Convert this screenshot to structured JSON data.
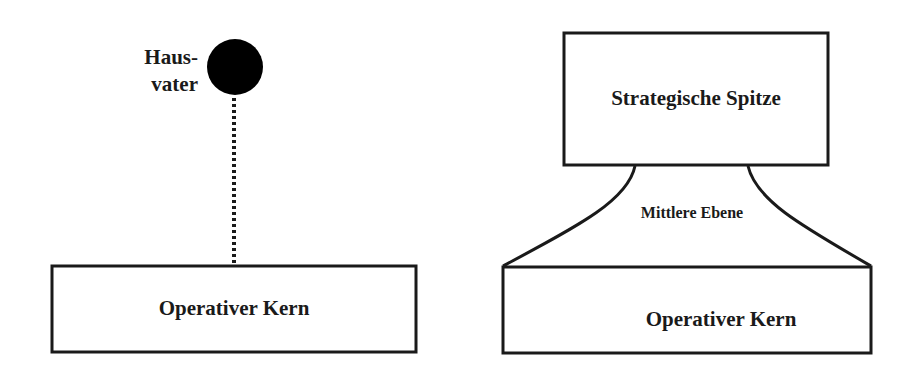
{
  "diagram": {
    "left_model": {
      "top_node": {
        "label_line1": "Haus-",
        "label_line2": "vater",
        "shape": "filled-circle",
        "fill": "#000000"
      },
      "connector": {
        "style": "dotted"
      },
      "bottom_box": {
        "label": "Operativer Kern"
      }
    },
    "right_model": {
      "top_box": {
        "label": "Strategische Spitze"
      },
      "middle_section": {
        "label": "Mittlere Ebene"
      },
      "bottom_box": {
        "label": "Operativer Kern"
      }
    },
    "colors": {
      "stroke": "#1a1a1a",
      "background": "#ffffff",
      "text": "#1a1a1a"
    }
  }
}
